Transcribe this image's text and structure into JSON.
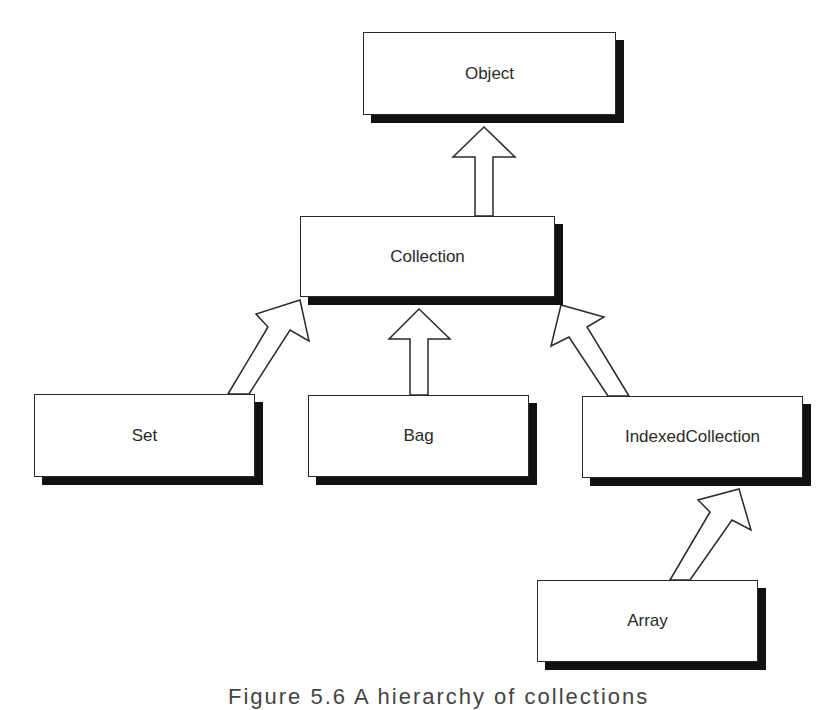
{
  "diagram": {
    "type": "class-hierarchy",
    "nodes": [
      {
        "id": "object",
        "label": "Object"
      },
      {
        "id": "collection",
        "label": "Collection"
      },
      {
        "id": "set",
        "label": "Set"
      },
      {
        "id": "bag",
        "label": "Bag"
      },
      {
        "id": "indexedcollection",
        "label": "IndexedCollection"
      },
      {
        "id": "array",
        "label": "Array"
      }
    ],
    "edges": [
      {
        "from": "collection",
        "to": "object",
        "kind": "inherits"
      },
      {
        "from": "set",
        "to": "collection",
        "kind": "inherits"
      },
      {
        "from": "bag",
        "to": "collection",
        "kind": "inherits"
      },
      {
        "from": "indexedcollection",
        "to": "collection",
        "kind": "inherits"
      },
      {
        "from": "array",
        "to": "indexedcollection",
        "kind": "inherits"
      }
    ],
    "caption": "Figure 5.6 A hierarchy of collections"
  },
  "colors": {
    "line": "#2a2a2a",
    "shadow": "#111111",
    "background": "#ffffff"
  }
}
